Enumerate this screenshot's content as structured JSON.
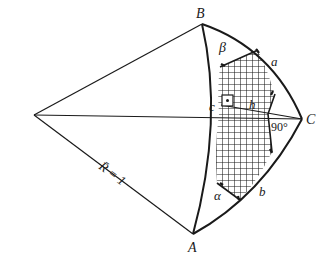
{
  "diagram": {
    "type": "spherical-triangle",
    "colors": {
      "stroke": "#1a1a1a",
      "background": "#ffffff",
      "hatch": "#1a1a1a"
    },
    "vertices": {
      "A": {
        "label": "A",
        "x": 193,
        "y": 234
      },
      "B": {
        "label": "B",
        "x": 202,
        "y": 24
      },
      "C": {
        "label": "C",
        "x": 302,
        "y": 119
      },
      "O": {
        "label": "",
        "x": 34,
        "y": 115
      }
    },
    "labels": {
      "vertex_a": "A",
      "vertex_b": "B",
      "vertex_c": "C",
      "side_a": "a",
      "side_b": "b",
      "side_c": "c",
      "angle_alpha": "α",
      "angle_beta": "β",
      "height": "h",
      "right_angle": "90°",
      "radius": "R̄ = 1"
    }
  }
}
